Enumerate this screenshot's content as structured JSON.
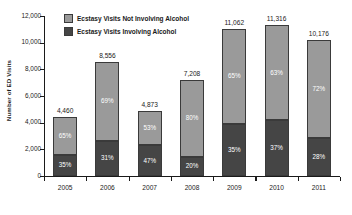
{
  "chart_data": {
    "type": "bar",
    "subtype": "stacked-bar-percent",
    "title": "",
    "xlabel": "",
    "ylabel": "Number of ED Visits",
    "ylim": [
      0,
      12000
    ],
    "ytick_step": 2000,
    "ytick_labels": [
      "0",
      "2,000",
      "4,000",
      "6,000",
      "8,000",
      "10,000",
      "12,000"
    ],
    "grid": false,
    "legend_position": "top-left-inside",
    "categories": [
      "2005",
      "2006",
      "2007",
      "2008",
      "2009",
      "2010",
      "2011"
    ],
    "totals": [
      4460,
      8556,
      4873,
      7208,
      11062,
      11316,
      10176
    ],
    "total_labels": [
      "4,460",
      "8,556",
      "4,873",
      "7,208",
      "11,062",
      "11,316",
      "10,176"
    ],
    "series": [
      {
        "name": "Ecstasy Visits Not Involving Alcohol",
        "color": "#9a9a9a",
        "stack_position": "top",
        "percent_values": [
          65,
          69,
          53,
          80,
          65,
          63,
          72
        ],
        "percent_labels": [
          "65%",
          "69%",
          "53%",
          "80%",
          "65%",
          "63%",
          "72%"
        ],
        "values": [
          2899,
          5904,
          2583,
          5766,
          7190,
          7129,
          7327
        ]
      },
      {
        "name": "Ecstasy Visits Involving Alcohol",
        "color": "#454545",
        "stack_position": "bottom",
        "percent_values": [
          35,
          31,
          47,
          20,
          35,
          37,
          28
        ],
        "percent_labels": [
          "35%",
          "31%",
          "47%",
          "20%",
          "35%",
          "37%",
          "28%"
        ],
        "values": [
          1561,
          2652,
          2290,
          1442,
          3872,
          4187,
          2849
        ]
      }
    ]
  },
  "legend": {
    "items": [
      {
        "label": "Ecstasy Visits Not Involving Alcohol",
        "color": "#9a9a9a"
      },
      {
        "label": "Ecstasy Visits Involving Alcohol",
        "color": "#454545"
      }
    ]
  },
  "axis": {
    "y_title": "Number of ED Visits"
  },
  "colors": {
    "not_involving_alcohol": "#9a9a9a",
    "involving_alcohol": "#454545",
    "axis": "#1a1a1a",
    "background": "#ffffff"
  }
}
